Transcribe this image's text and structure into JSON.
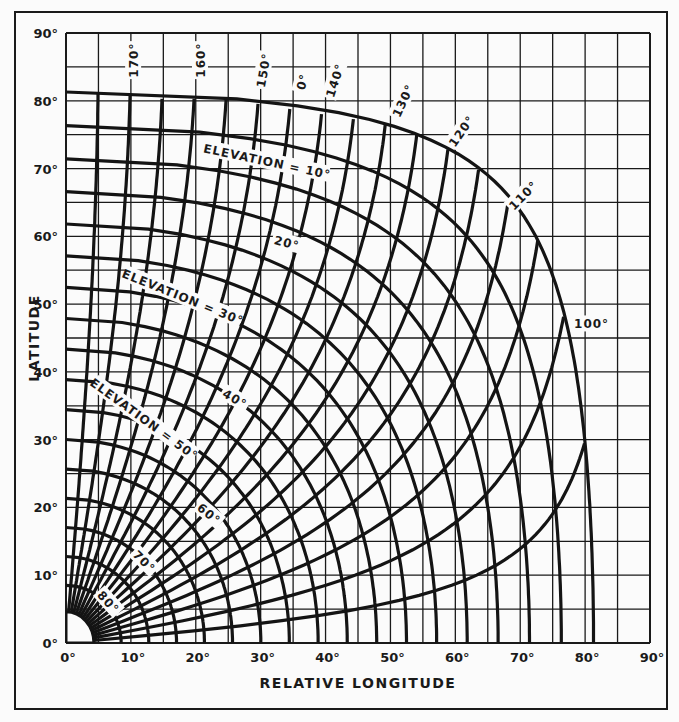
{
  "chart_data": {
    "type": "line",
    "title": "",
    "xlabel": "RELATIVE LONGITUDE",
    "ylabel": "LATITUDE",
    "xlim": [
      0,
      90
    ],
    "ylim": [
      0,
      90
    ],
    "grid": true,
    "grid_step_deg": 5,
    "x_ticks": [
      "0°",
      "10°",
      "20°",
      "30°",
      "40°",
      "50°",
      "60°",
      "70°",
      "80°",
      "90°"
    ],
    "y_ticks": [
      "0°",
      "10°",
      "20°",
      "30°",
      "40°",
      "50°",
      "60°",
      "70°",
      "80°",
      "90°"
    ],
    "elevation_curves_deg": [
      0,
      5,
      10,
      15,
      20,
      25,
      30,
      35,
      40,
      45,
      50,
      55,
      60,
      65,
      70,
      75,
      80,
      85
    ],
    "azimuth_curves_deg": [
      95,
      100,
      105,
      110,
      115,
      120,
      125,
      130,
      135,
      140,
      145,
      150,
      155,
      160,
      165,
      170,
      175
    ],
    "earth_radius_ratio_k": 0.1513,
    "labels": {
      "elevation": [
        {
          "text": "ELEVATION = 10°",
          "x": 31,
          "y": 71,
          "angle": 12
        },
        {
          "text": "20°",
          "x": 34,
          "y": 59,
          "angle": 15
        },
        {
          "text": "ELEVATION = 30°",
          "x": 18,
          "y": 51,
          "angle": 22
        },
        {
          "text": "40°",
          "x": 26,
          "y": 36,
          "angle": 30
        },
        {
          "text": "ELEVATION = 50°",
          "x": 12,
          "y": 33,
          "angle": 36
        },
        {
          "text": "60°",
          "x": 22,
          "y": 19,
          "angle": 40
        },
        {
          "text": "70°",
          "x": 12,
          "y": 12,
          "angle": 45
        },
        {
          "text": "80°",
          "x": 6.5,
          "y": 6,
          "angle": 48
        }
      ],
      "azimuth": [
        {
          "text": "170°",
          "x": 10.5,
          "y": 86,
          "angle": -90
        },
        {
          "text": "160°",
          "x": 20.8,
          "y": 86,
          "angle": -90
        },
        {
          "text": "150°",
          "x": 30.5,
          "y": 84.5,
          "angle": -80
        },
        {
          "text": "0°",
          "x": 36.5,
          "y": 82.8,
          "angle": -75
        },
        {
          "text": "140°",
          "x": 41.5,
          "y": 83,
          "angle": -72
        },
        {
          "text": "130°",
          "x": 52,
          "y": 80,
          "angle": -65
        },
        {
          "text": "120°",
          "x": 61,
          "y": 75.5,
          "angle": -55
        },
        {
          "text": "110°",
          "x": 70.5,
          "y": 66,
          "angle": -45
        },
        {
          "text": "100°",
          "x": 81,
          "y": 47,
          "angle": 0
        }
      ]
    }
  }
}
